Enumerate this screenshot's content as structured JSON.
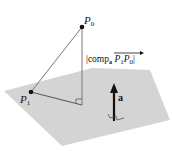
{
  "diagram": {
    "colors": {
      "plane": "#d4d4d4",
      "lines": "#555555",
      "points": "#111111",
      "arrow": "#111111",
      "text": "#111111"
    },
    "points": {
      "p0": {
        "label": "P",
        "sub": "0"
      },
      "p1": {
        "label": "P",
        "sub": "1"
      }
    },
    "normal_vector": {
      "label": "a"
    },
    "projection_label": {
      "bar_left": "|",
      "func": "comp",
      "func_sub": "a",
      "vec_p": "P",
      "vec_p_sub": "1",
      "vec_q": "P",
      "vec_q_sub": "0",
      "bar_right": "|"
    }
  }
}
